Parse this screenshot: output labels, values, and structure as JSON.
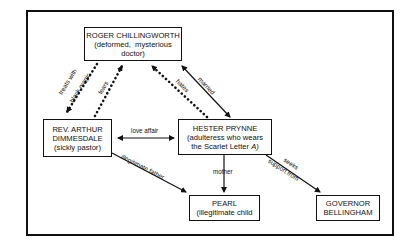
{
  "diagram": {
    "type": "character relationship map",
    "nodes": {
      "chillingworth": {
        "name": "ROGER CHILLINGWORTH",
        "desc": [
          "(deformed,  mysterious",
          "doctor)"
        ]
      },
      "dimmesdale": {
        "name": [
          "REV. ARTHUR",
          "DIMMESDALE"
        ],
        "desc": "(sickly pastor)"
      },
      "hester": {
        "name": "HESTER PRYNNE",
        "desc": [
          "(adulteress who wears",
          "the Scarlet Letter A)"
        ]
      },
      "pearl": {
        "name": "PEARL",
        "desc": "(illegitimate child"
      },
      "bellingham": {
        "name": [
          "GOVERNOR",
          "BELLINGHAM"
        ]
      }
    },
    "edges": [
      {
        "from": "chillingworth",
        "to": "dimmesdale",
        "label": "treats with black magic",
        "style": "dotted",
        "arrow": "to"
      },
      {
        "from": "dimmesdale",
        "to": "chillingworth",
        "label": "fears",
        "style": "dotted",
        "arrow": "to"
      },
      {
        "from": "hester",
        "to": "chillingworth",
        "label": "hates",
        "style": "dotted",
        "arrow": "to"
      },
      {
        "from": "chillingworth",
        "to": "hester",
        "label": "married",
        "style": "solid",
        "arrow": "both"
      },
      {
        "from": "dimmesdale",
        "to": "hester",
        "label": "love affair",
        "style": "solid",
        "arrow": "both"
      },
      {
        "from": "dimmesdale",
        "to": "pearl",
        "label": "illegitimate father",
        "style": "solid",
        "arrow": "to"
      },
      {
        "from": "hester",
        "to": "pearl",
        "label": "mother",
        "style": "solid",
        "arrow": "to"
      },
      {
        "from": "hester",
        "to": "bellingham",
        "label": "seeks support from",
        "style": "solid",
        "arrow": "to"
      }
    ],
    "labels": {
      "treats1": "treats with",
      "treats2": "black magic",
      "fears": "fears",
      "hates": "hates",
      "married": "married",
      "love": "love affair",
      "father": "illegitimate father",
      "mother": "mother",
      "seeks1": "seeks",
      "seeks2": "support from"
    }
  }
}
